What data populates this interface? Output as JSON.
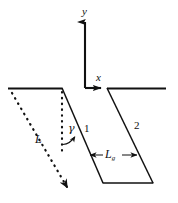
{
  "figure": {
    "type": "geometry-diagram",
    "title": "",
    "background_color": "#ffffff",
    "line_color": "#111111",
    "labels": {
      "y_axis": "y",
      "x_axis": "x",
      "angle": "γ",
      "plane_one": "1",
      "plane_two": "2",
      "length_L": "L",
      "length_Lg_base": "L",
      "length_Lg_subscript": "g"
    },
    "icons": {
      "y_axis_arrow": "arrow-up-icon",
      "x_axis_arrow": "arrow-right-icon",
      "L_dotted_arrow": "dotted-arrow-down-right-icon",
      "Lg_dimension_arrow": "double-headed-arrow-icon",
      "angle_arc_arrow": "angle-arc-arrow-icon"
    },
    "geometry": {
      "origin": [
        85,
        88
      ],
      "y_axis": {
        "from": [
          85,
          88
        ],
        "to": [
          85,
          18
        ]
      },
      "x_axis": {
        "from": [
          85,
          88
        ],
        "to": [
          106,
          88
        ]
      },
      "horizontal_left": {
        "from": [
          8,
          88
        ],
        "to": [
          62,
          88
        ]
      },
      "horizontal_right": {
        "from": [
          107,
          88
        ],
        "to": [
          166,
          88
        ]
      },
      "slant_1": {
        "from": [
          62,
          88
        ],
        "to": [
          103,
          183
        ]
      },
      "slant_2": {
        "from": [
          107,
          88
        ],
        "to": [
          153,
          183
        ]
      },
      "bottom_edge": {
        "from": [
          103,
          183
        ],
        "to": [
          153,
          183
        ]
      },
      "dotted_vertical": {
        "from": [
          62,
          89
        ],
        "to": [
          62,
          151
        ]
      },
      "dotted_diagonal": {
        "from": [
          12,
          93
        ],
        "to": [
          70,
          192
        ]
      },
      "Lg_dimension": {
        "from": [
          90,
          155
        ],
        "to": [
          137,
          155
        ]
      }
    }
  }
}
